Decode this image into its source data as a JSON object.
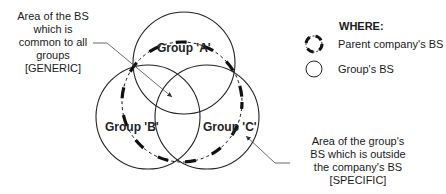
{
  "diagram": {
    "groups": [
      {
        "id": "A",
        "label": "Group 'A'"
      },
      {
        "id": "B",
        "label": "Group 'B'"
      },
      {
        "id": "C",
        "label": "Group 'C'"
      }
    ],
    "annotations": {
      "generic": [
        "Area of the BS",
        "which is",
        "common to all",
        "groups",
        "[GENERIC]"
      ],
      "specific": [
        "Area of the group's",
        "BS which is outside",
        "the company's BS",
        "[SPECIFIC]"
      ]
    },
    "legend": {
      "title": "WHERE:",
      "items": [
        {
          "icon": "dashed-circle-icon",
          "label": "Parent company's BS"
        },
        {
          "icon": "circle-icon",
          "label": "Group's BS"
        }
      ]
    }
  }
}
